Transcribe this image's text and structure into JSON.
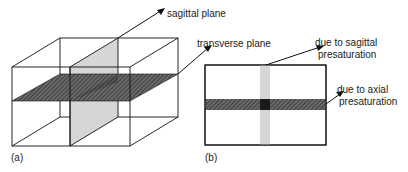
{
  "figure_a": {
    "panel_label": "(a)",
    "labels": {
      "sagittal": "sagittal plane",
      "transverse": "transverse plane"
    }
  },
  "figure_b": {
    "panel_label": "(b)",
    "labels": {
      "sagittal_line1": "due to sagittal",
      "sagittal_line2": "presaturation",
      "axial_line1": "due to axial",
      "axial_line2": "presaturation"
    }
  },
  "colors": {
    "line": "#111111",
    "sagittal_fill": "#d4d4d4",
    "transverse_fill": "#555555"
  }
}
